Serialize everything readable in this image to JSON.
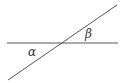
{
  "diagram": {
    "type": "intersecting-lines",
    "labels": {
      "alpha": "α",
      "beta": "β"
    },
    "line_color": "#555555"
  }
}
